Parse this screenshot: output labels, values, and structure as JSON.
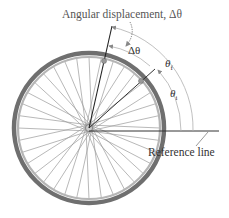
{
  "figure": {
    "title_label": "Angular displacement, Δθ",
    "delta_theta_label": "Δθ",
    "theta_final": {
      "symbol": "θ",
      "subscript": "f"
    },
    "theta_initial": {
      "symbol": "θ",
      "subscript": "i"
    },
    "reference_label": "Reference line"
  },
  "geometry": {
    "hub": [
      89,
      128
    ],
    "rim_radius": 76,
    "spoke_count": 36,
    "colors": {
      "rim": "#8a8a8a",
      "tire": "#6f6f6f",
      "spoke": "#9a9a9a",
      "line": "#333333",
      "arc": "#b0b0b0"
    }
  }
}
